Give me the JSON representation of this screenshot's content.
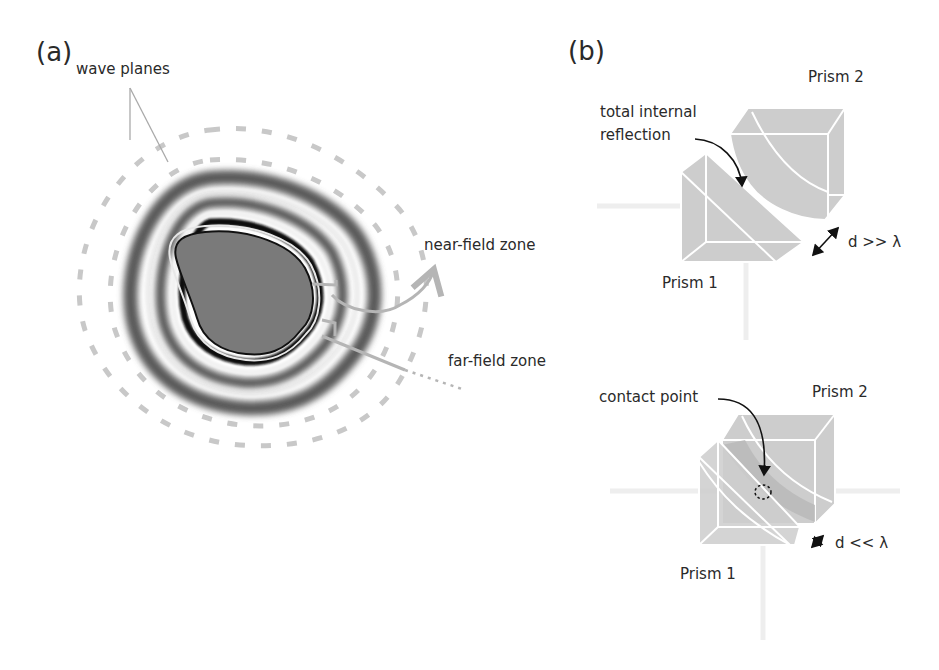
{
  "panels": {
    "a": {
      "label": "(a)",
      "annotations": {
        "wave_planes": "wave planes",
        "near_field": "near-field zone",
        "far_field": "far-field zone"
      }
    },
    "b": {
      "label": "(b)",
      "top": {
        "prism2": "Prism 2",
        "prism1": "Prism 1",
        "annotation": "total internal reflection",
        "annotation_line1": "total internal",
        "annotation_line2": "reflection",
        "distance": "d >> λ"
      },
      "bottom": {
        "prism2": "Prism 2",
        "prism1": "Prism 1",
        "annotation": "contact point",
        "distance": "d << λ"
      }
    }
  },
  "colors": {
    "object_fill": "#7a7a7a",
    "ring_dark": "#555555",
    "ring_black": "#111111",
    "wave_dash": "#c4c4c4",
    "prism_fill": "#cfcfcf",
    "prism_edge": "#ffffff",
    "arrow_gray": "#b5b5b5",
    "arrow_black": "#111111"
  }
}
